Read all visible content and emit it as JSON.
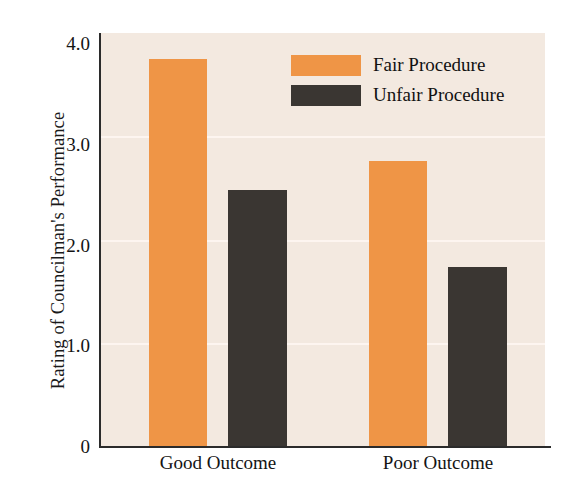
{
  "chart_data": {
    "type": "bar",
    "title": "",
    "xlabel": "",
    "ylabel": "Rating of Councilman's Performance",
    "categories": [
      "Good Outcome",
      "Poor Outcome"
    ],
    "series": [
      {
        "name": "Fair Procedure",
        "color": "#ef9546",
        "values": [
          3.75,
          2.76
        ]
      },
      {
        "name": "Unfair Procedure",
        "color": "#3a3632",
        "values": [
          2.48,
          1.73
        ]
      }
    ],
    "ylim": [
      0,
      4.0
    ],
    "ytick_labels": [
      "4.0",
      "3.0",
      "2.0",
      "1.0",
      "0"
    ],
    "ytick_values": [
      4.0,
      3.0,
      2.0,
      1.0,
      0
    ],
    "grid": true,
    "gridlines_at": [
      3.0,
      2.0,
      1.0
    ],
    "legend_position": "top-center",
    "plot_background": "#f3e9e0",
    "axis_color": "#2b2b2b"
  },
  "legend": {
    "entries": [
      {
        "label": "Fair Procedure",
        "swatch": "fair"
      },
      {
        "label": "Unfair Procedure",
        "swatch": "unfair"
      }
    ]
  },
  "axes": {
    "y_title": "Rating of Councilman's Performance",
    "y_ticks": [
      "4.0",
      "3.0",
      "2.0",
      "1.0",
      "0"
    ],
    "x_categories": [
      "Good Outcome",
      "Poor Outcome"
    ]
  }
}
